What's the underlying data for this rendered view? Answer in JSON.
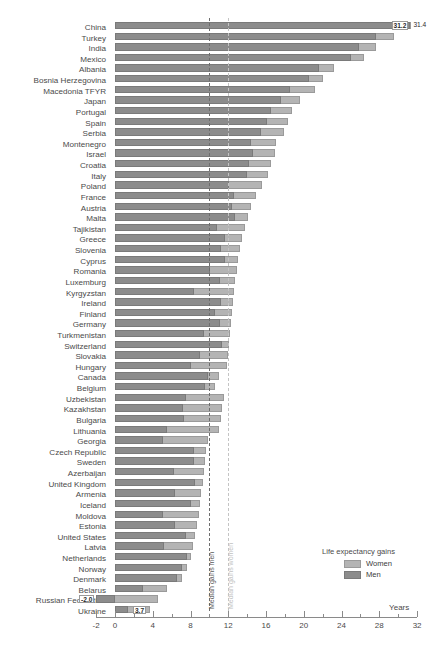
{
  "title": "",
  "axis": {
    "x_label": "Years",
    "ticks": [
      "-2",
      "0",
      "4",
      "8",
      "12",
      "16",
      "20",
      "24",
      "28",
      "32"
    ],
    "xlim": [
      -2,
      32
    ]
  },
  "medians": {
    "men_label": "Median gains men",
    "women_label": "Median gains women",
    "men_value": 10.0,
    "women_value": 12.0
  },
  "legend": {
    "title": "Life expectancy gains",
    "women": "Women",
    "men": "Men"
  },
  "colors": {
    "women": "#b4b4b4",
    "men": "#8c8c8c",
    "median_men": "#6d6d6d",
    "median_women": "#c4c4c4"
  },
  "chart_data": {
    "type": "bar",
    "title": "Life expectancy gains",
    "xlabel": "Years",
    "ylabel": "",
    "xlim": [
      -2,
      32
    ],
    "grid": false,
    "legend_position": "bottom-right",
    "orientation": "horizontal",
    "categories": [
      "China",
      "Turkey",
      "India",
      "Mexico",
      "Albania",
      "Bosnia Herzegovina",
      "Macedonia TFYR",
      "Japan",
      "Portugal",
      "Spain",
      "Serbia",
      "Montenegro",
      "Israel",
      "Croatia",
      "Italy",
      "Poland",
      "France",
      "Austria",
      "Malta",
      "Tajikistan",
      "Greece",
      "Slovenia",
      "Cyprus",
      "Romania",
      "Luxemburg",
      "Kyrgyzstan",
      "Ireland",
      "Finland",
      "Germany",
      "Turkmenistan",
      "Switzerland",
      "Slovakia",
      "Hungary",
      "Canada",
      "Belgium",
      "Uzbekistan",
      "Kazakhstan",
      "Bulgaria",
      "Lithuania",
      "Georgia",
      "Czech Republic",
      "Sweden",
      "Azerbaijan",
      "United Kingdom",
      "Armenia",
      "Iceland",
      "Moldova",
      "Estonia",
      "United States",
      "Latvia",
      "Netherlands",
      "Norway",
      "Denmark",
      "Belarus",
      "Russian Federation",
      "Ukraine"
    ],
    "series": [
      {
        "name": "Women",
        "values": [
          31.4,
          29.6,
          27.6,
          26.4,
          23.2,
          22.0,
          21.2,
          19.6,
          18.7,
          18.3,
          17.9,
          17.1,
          16.9,
          16.5,
          16.2,
          15.6,
          14.9,
          14.4,
          14.1,
          13.8,
          13.5,
          13.2,
          13.0,
          12.9,
          12.7,
          12.6,
          12.5,
          12.4,
          12.3,
          12.2,
          12.1,
          12.0,
          11.9,
          11.0,
          10.6,
          11.5,
          11.3,
          11.2,
          11.0,
          9.8,
          9.6,
          9.5,
          9.4,
          9.3,
          9.1,
          9.0,
          8.9,
          8.7,
          8.5,
          8.3,
          8.0,
          7.6,
          7.1,
          5.5,
          4.6,
          3.7
        ]
      },
      {
        "name": "Men",
        "values": [
          31.2,
          27.7,
          25.8,
          25.0,
          21.6,
          20.6,
          18.5,
          17.6,
          16.5,
          16.1,
          15.5,
          14.4,
          14.6,
          14.2,
          14.0,
          12.1,
          12.6,
          12.4,
          12.7,
          10.8,
          11.7,
          11.2,
          11.7,
          10.1,
          11.1,
          8.4,
          11.2,
          10.6,
          11.1,
          9.4,
          11.3,
          9.0,
          8.1,
          9.9,
          9.5,
          7.5,
          7.2,
          7.3,
          5.5,
          5.1,
          8.4,
          8.4,
          6.2,
          8.5,
          6.4,
          8.1,
          5.1,
          6.4,
          7.5,
          5.2,
          7.6,
          7.1,
          6.6,
          3.0,
          -2.0,
          1.4
        ]
      }
    ],
    "labeled_values": [
      {
        "category": "China",
        "men_label": "31.2",
        "women_label": "31.4"
      },
      {
        "category": "Russian Federation",
        "men_label": "-2.0"
      },
      {
        "category": "Ukraine",
        "women_label": "3.7"
      }
    ]
  }
}
